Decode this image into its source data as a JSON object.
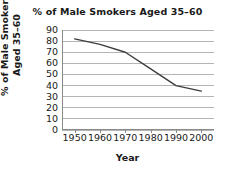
{
  "chart_data": {
    "type": "line",
    "title": "% of Male Smokers Aged 35–60",
    "xlabel": "Year",
    "ylabel": "% of Male Smokers Aged 35–60",
    "ylabel_lines": [
      "% of Male Smokers",
      "Aged 35–60"
    ],
    "x": [
      1950,
      1960,
      1970,
      1980,
      1990,
      2000
    ],
    "values": [
      82,
      77,
      70,
      55,
      40,
      35
    ],
    "categories": [
      "1950",
      "1960",
      "1970",
      "1980",
      "1990",
      "2000"
    ],
    "xticklabels": [
      "1950",
      "1960",
      "1970",
      "1980",
      "1990",
      "2000"
    ],
    "yticklabels": [
      "90",
      "80",
      "70",
      "60",
      "50",
      "40",
      "30",
      "20",
      "10",
      "0"
    ],
    "yticks": [
      90,
      80,
      70,
      60,
      50,
      40,
      30,
      20,
      10,
      0
    ],
    "xlim": [
      1945,
      2005
    ],
    "ylim": [
      0,
      90
    ],
    "grid": "horizontal",
    "legend": "none",
    "series": [
      {
        "name": "% of Male Smokers Aged 35–60",
        "values": [
          82,
          77,
          70,
          55,
          40,
          35
        ]
      }
    ],
    "colors": {
      "line": "#3d3d3d",
      "gridline": "#b4b4b4",
      "axis": "#8a8a8a",
      "text": "#1a1a1a",
      "background": "#ffffff"
    }
  }
}
